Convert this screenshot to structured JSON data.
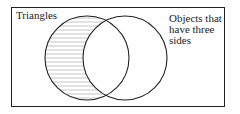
{
  "diagram": {
    "type": "venn",
    "frame": {
      "x": 11,
      "y": 7,
      "width": 214,
      "height": 100
    },
    "sets": [
      {
        "id": "A",
        "label": "Triangles",
        "cx": 87,
        "cy": 58,
        "r": 42
      },
      {
        "id": "B",
        "label_lines": [
          "Objects that",
          "have three",
          "sides"
        ],
        "cx": 125,
        "cy": 58,
        "r": 42
      }
    ],
    "shaded_region": "A minus B",
    "hatch": {
      "direction": "horizontal",
      "spacing": 4,
      "color": "#b8b8b8"
    },
    "colors": {
      "stroke": "#222222",
      "background": "#ffffff"
    }
  },
  "labels": {
    "left": "Triangles",
    "right": [
      "Objects that",
      "have three",
      "sides"
    ]
  }
}
